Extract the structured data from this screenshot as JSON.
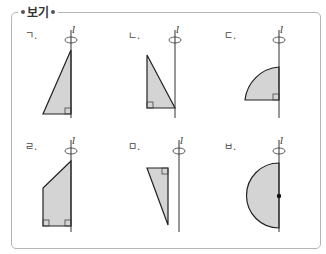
{
  "title": "보기",
  "axis_label": "l",
  "items": [
    {
      "label": "ㄱ.",
      "shape": "right-triangle-leaning-axis"
    },
    {
      "label": "ㄴ.",
      "shape": "right-triangle-left"
    },
    {
      "label": "ㄷ.",
      "shape": "quarter-circle"
    },
    {
      "label": "ㄹ.",
      "shape": "trapezoid"
    },
    {
      "label": "ㅁ.",
      "shape": "detached-triangle"
    },
    {
      "label": "ㅂ.",
      "shape": "semicircle"
    }
  ],
  "colors": {
    "fill": "#d4d4d4",
    "stroke": "#222222",
    "border": "#b5b5b5"
  }
}
